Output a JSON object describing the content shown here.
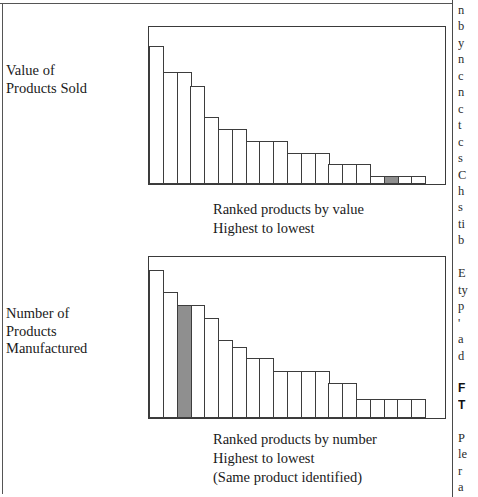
{
  "document": {
    "type": "scanned-book-figure",
    "page_background": "#ffffff",
    "ink_color": "#1a1a1a",
    "highlight_color": "#8f8f8f",
    "bar_outline_color": "#3d3d3d",
    "frame_color": "#3a3a3a"
  },
  "figure": {
    "panels": [
      {
        "id": "value-of-products-sold",
        "axis_title": "Value of\nProducts Sold",
        "caption": "Ranked products by value\nHighest to lowest"
      },
      {
        "id": "number-of-products-manufactured",
        "axis_title": "Number of\nProducts\nManufactured",
        "caption": "Ranked products by number\nHighest to lowest\n(Same product identified)"
      }
    ]
  },
  "chart_data": [
    {
      "type": "bar",
      "id": "value-of-products-sold",
      "title": "Value of Products Sold",
      "xlabel": "Ranked products by value\nHighest to lowest",
      "ylabel": "Value of Products Sold",
      "grid": false,
      "legend": "none",
      "axis_ticks": "none",
      "ylim": [
        0,
        100
      ],
      "categories": [
        "1",
        "2",
        "3",
        "4",
        "5",
        "6",
        "7",
        "8",
        "9",
        "10",
        "11",
        "12",
        "13",
        "14",
        "15",
        "16",
        "17",
        "18",
        "19",
        "20"
      ],
      "values": [
        90,
        73,
        73,
        64,
        44,
        36,
        36,
        28,
        28,
        28,
        20,
        20,
        20,
        13,
        13,
        13,
        5,
        5,
        5,
        5
      ],
      "highlighted_index": 17,
      "highlight_label": "Same product identified",
      "highlight_color": "#8f8f8f",
      "annotation": "Pareto-style descending distribution of product sales value; one product highlighted near the low-value tail."
    },
    {
      "type": "bar",
      "id": "number-of-products-manufactured",
      "title": "Number of Products Manufactured",
      "xlabel": "Ranked products by number\nHighest to lowest\n(Same product identified)",
      "ylabel": "Number of Products Manufactured",
      "grid": false,
      "legend": "none",
      "axis_ticks": "none",
      "ylim": [
        0,
        100
      ],
      "categories": [
        "1",
        "2",
        "3",
        "4",
        "5",
        "6",
        "7",
        "8",
        "9",
        "10",
        "11",
        "12",
        "13",
        "14",
        "15",
        "16",
        "17",
        "18",
        "19",
        "20"
      ],
      "values": [
        94,
        80,
        72,
        72,
        64,
        50,
        45,
        38,
        38,
        30,
        30,
        30,
        30,
        22,
        22,
        12,
        12,
        12,
        12,
        12
      ],
      "highlighted_index": 2,
      "highlight_label": "Same product identified",
      "highlight_color": "#8f8f8f",
      "annotation": "Descending distribution of manufactured volume; the same product appears at rank 3, i.e. high volume but low value."
    }
  ],
  "text_column": {
    "top_lines": [
      "n",
      "b",
      "y",
      "n",
      "c",
      "n",
      "c",
      "t",
      "c",
      "s",
      "C",
      "h",
      "s",
      "ti",
      "b"
    ],
    "bottom_block_a": [
      "E",
      "ty",
      "p",
      "'",
      "a",
      "d"
    ],
    "bottom_heading": [
      "F",
      "T"
    ],
    "bottom_block_b": [
      "P",
      "le",
      "r",
      "a",
      "c"
    ]
  }
}
